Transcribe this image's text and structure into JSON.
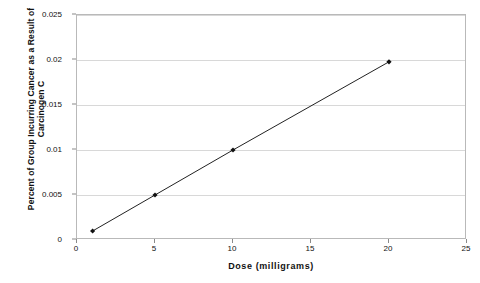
{
  "chart_data": {
    "type": "line",
    "title": "",
    "xlabel": "Dose (milligrams)",
    "ylabel": "Percent of Group Incurring Cancer as a Result of Carcinogen C",
    "ylabel_lines": [
      "Percent of Group Incurring Cancer as a Result of",
      "Carcinogen C"
    ],
    "xlim": [
      0,
      25
    ],
    "ylim": [
      0,
      0.025
    ],
    "xticks": [
      0,
      5,
      10,
      15,
      20,
      25
    ],
    "xtick_labels": [
      "0",
      "5",
      "10",
      "15",
      "20",
      "25"
    ],
    "yticks": [
      0,
      0.005,
      0.01,
      0.015,
      0.02,
      0.025
    ],
    "ytick_labels": [
      "0",
      "0.005",
      "0.01",
      "0.015",
      "0.02",
      "0.025"
    ],
    "grid": "horizontal",
    "legend": "none",
    "series": [
      {
        "name": "Carcinogen C",
        "marker": "diamond",
        "line_color": "#222222",
        "marker_color": "#111111",
        "x": [
          1,
          5,
          10,
          20
        ],
        "values": [
          0.001,
          0.005,
          0.01,
          0.0198
        ],
        "points": [
          {
            "x": 1,
            "y": 0.001
          },
          {
            "x": 5,
            "y": 0.005
          },
          {
            "x": 10,
            "y": 0.01
          },
          {
            "x": 20,
            "y": 0.0198
          }
        ]
      }
    ],
    "colors": {
      "background": "#ffffff",
      "gridline": "#d8d8d8",
      "frame": "#b9b9b9",
      "text": "#111111",
      "series_line": "#222222"
    }
  }
}
